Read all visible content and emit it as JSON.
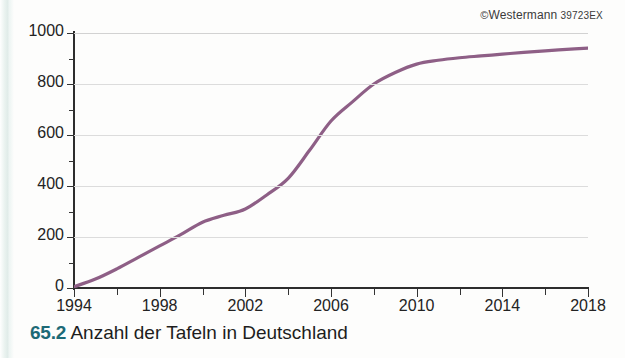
{
  "credit": {
    "mark": "©",
    "publisher": "Westermann",
    "code": "39723EX"
  },
  "caption": {
    "number": "65.2",
    "text": "Anzahl der Tafeln in Deutschland",
    "number_color": "#1d6a76"
  },
  "colors": {
    "line": "#8e5f86",
    "grid": "#dcdcdc",
    "axis": "#2d2d2d",
    "text": "#232323",
    "background": "#fdfdfc",
    "scan_edge": "#dce9e6"
  },
  "chart_data": {
    "type": "line",
    "title": "Anzahl der Tafeln in Deutschland",
    "xlabel": "",
    "ylabel": "",
    "xlim": [
      1994,
      2018
    ],
    "ylim": [
      0,
      1000
    ],
    "grid": true,
    "legend": null,
    "xticks": [
      1994,
      1998,
      2002,
      2006,
      2010,
      2014,
      2018
    ],
    "xticks_minor": [
      1996,
      2000,
      2004,
      2008,
      2012,
      2016
    ],
    "yticks": [
      0,
      200,
      400,
      600,
      800,
      1000
    ],
    "yticks_minor": [
      100,
      300,
      500,
      700,
      900
    ],
    "x": [
      1994,
      1995,
      1996,
      1997,
      1998,
      1999,
      2000,
      2001,
      2002,
      2003,
      2004,
      2005,
      2006,
      2007,
      2008,
      2009,
      2010,
      2011,
      2012,
      2013,
      2014,
      2015,
      2016,
      2017,
      2018
    ],
    "values": [
      5,
      35,
      75,
      120,
      165,
      210,
      258,
      285,
      310,
      365,
      430,
      540,
      655,
      730,
      800,
      845,
      878,
      893,
      903,
      910,
      917,
      924,
      930,
      936,
      941
    ],
    "series": [
      {
        "name": "Anzahl der Tafeln",
        "color": "#8e5f86",
        "values": [
          5,
          35,
          75,
          120,
          165,
          210,
          258,
          285,
          310,
          365,
          430,
          540,
          655,
          730,
          800,
          845,
          878,
          893,
          903,
          910,
          917,
          924,
          930,
          936,
          941
        ]
      }
    ]
  }
}
